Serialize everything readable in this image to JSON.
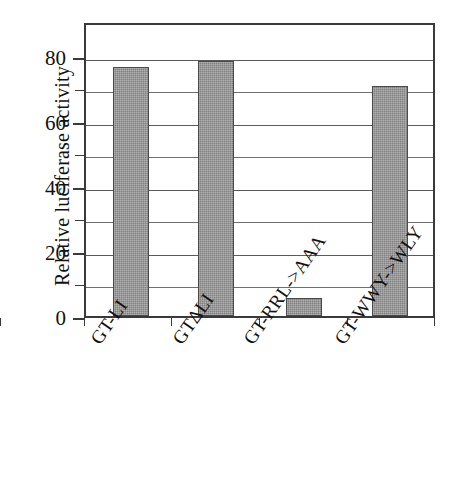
{
  "chart_data": {
    "type": "bar",
    "title": "",
    "xlabel": "",
    "ylabel": "Relative luciferase activity",
    "categories": [
      "GT-LI",
      "GTΔLI",
      "GT-RRL->AAA",
      "GT-WWY->WLY"
    ],
    "values": [
      77,
      79,
      5.5,
      71
    ],
    "ylim": [
      0,
      90
    ],
    "y_tick_labels": [
      "0",
      "20",
      "40",
      "60",
      "80"
    ],
    "y_tick_values": [
      0,
      20,
      40,
      60,
      80
    ],
    "y_minor_tick_values": [
      10,
      30,
      50,
      70
    ],
    "grid": true,
    "grid_axis": "y",
    "legend": null,
    "series_color": "#808080",
    "axis_color": "#3a3a3a",
    "background": "#ffffff"
  },
  "figure": {
    "y_axis_title": "Relative luciferase activity",
    "tick_labels": {
      "t0": "0",
      "t20": "20",
      "t40": "40",
      "t60": "60",
      "t80": "80"
    },
    "category_labels": {
      "c0": "GT-LI",
      "c1": "GTΔLI",
      "c2": "GT-RRL->AAA",
      "c3": "GT-WWY->WLY"
    }
  }
}
